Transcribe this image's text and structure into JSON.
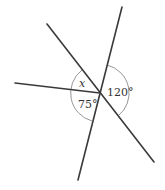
{
  "diagram": {
    "type": "intersecting-lines-angles",
    "intersection": {
      "x": 100,
      "y": 93
    },
    "lines": [
      {
        "id": "line-nw-se",
        "x1": 47,
        "y1": 24,
        "x2": 154,
        "y2": 162
      },
      {
        "id": "line-nne-ssw",
        "x1": 122,
        "y1": 7,
        "x2": 78,
        "y2": 180
      },
      {
        "id": "ray-west",
        "x1": 15,
        "y1": 83,
        "x2": 100,
        "y2": 93
      }
    ],
    "angles": [
      {
        "id": "angle-x",
        "label": "x",
        "italic": true
      },
      {
        "id": "angle-75",
        "label": "75°"
      },
      {
        "id": "angle-120",
        "label": "120°"
      }
    ],
    "colors": {
      "line": "#3a3a3a",
      "arc": "#8a8a8a",
      "text": "#333333",
      "background": "#ffffff"
    }
  }
}
